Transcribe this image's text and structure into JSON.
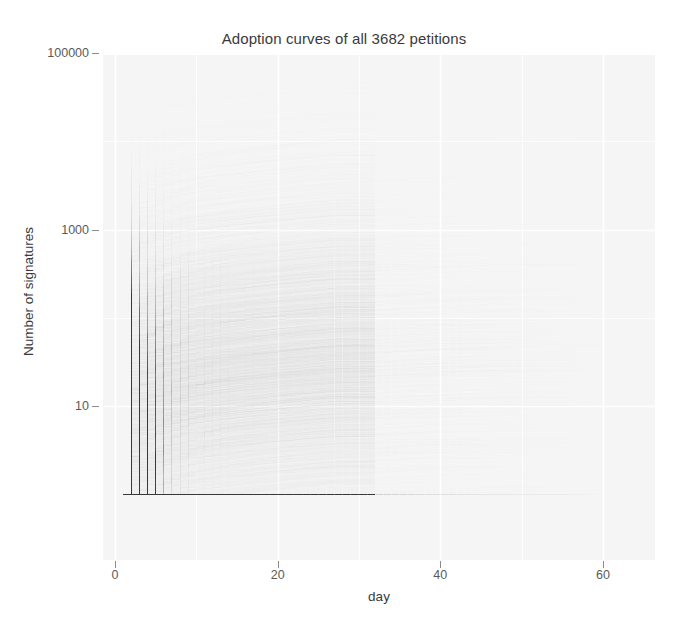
{
  "chart_data": {
    "type": "line",
    "title": "Adoption curves of all 3682 petitions",
    "xlabel": "day",
    "ylabel": "Number of signatures",
    "subtitle": "",
    "n_curves": 3682,
    "grid": true,
    "legend": false,
    "legend_position": "none",
    "xscale": "linear",
    "yscale": "log10",
    "xlim": [
      -1.5,
      66.5
    ],
    "ylim": [
      1,
      300000
    ],
    "x_ticks": [
      0,
      20,
      40,
      60
    ],
    "x_tick_labels": [
      "0",
      "20",
      "40",
      "60"
    ],
    "x_minor_ticks": [
      10,
      30,
      50
    ],
    "y_ticks": [
      10,
      1000,
      100000
    ],
    "y_tick_labels": [
      "10",
      "1000",
      "100000"
    ],
    "y_minor_ticks": [
      100,
      10000
    ],
    "annotations": [
      {
        "label": "deadline-cutoff",
        "x": 32,
        "note": "sharp vertical density edge where most petitions close"
      }
    ],
    "series_summary": {
      "start_day": 1,
      "deadline_day": 32,
      "end_day": 60,
      "median_final_signatures": 40,
      "max_final_signatures": 120000,
      "min_final_signatures": 1
    },
    "colors": {
      "panel_background": "#f2f2f2",
      "gridline_major": "#ffffff",
      "gridline_minor": "#ffffff",
      "line": "#000000",
      "title_text": "#3a3a3a",
      "axis_text": "#5a5a5a",
      "tick_mark": "#8c8c8c",
      "figure_background": "#ffffff"
    },
    "render": {
      "panel_px": {
        "left": 103,
        "top": 55,
        "width": 552,
        "height": 505
      },
      "x_px": {
        "day0": 115,
        "per_day": 8.133
      },
      "y_px": {
        "log10_1": 494.5,
        "px_per_decade": 88.3,
        "panel_top_offset": 55
      },
      "line_alpha": 0.014,
      "line_width": 0.7,
      "seed": 20110314,
      "step_shape": "daily-riser-comb"
    }
  }
}
